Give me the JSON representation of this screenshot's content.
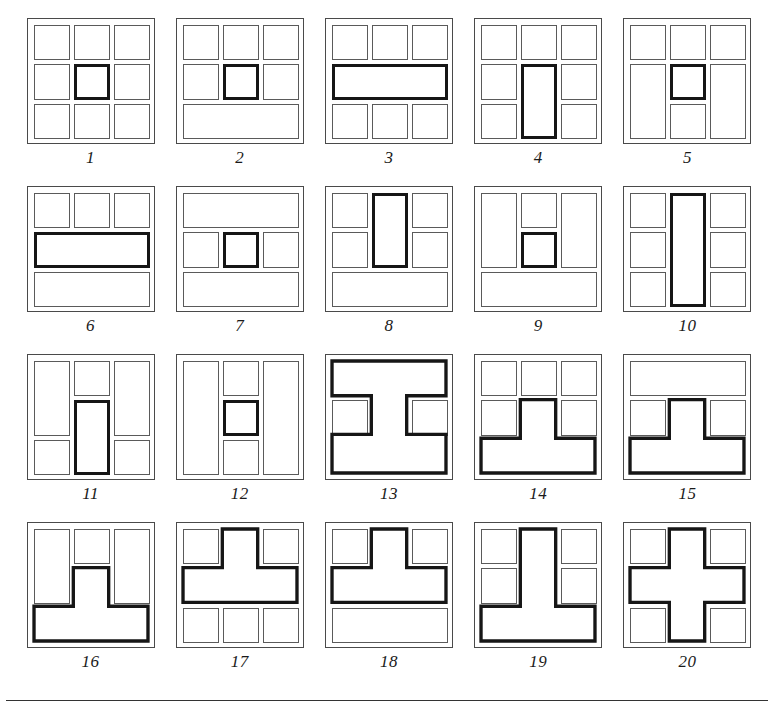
{
  "page": {
    "figure_count": 20,
    "bottom_rule": true,
    "colors": {
      "thin_stroke": "#5a5a5a",
      "bold_stroke": "#161616",
      "background": "#ffffff",
      "caption": "#1a1a1a"
    }
  },
  "figures": [
    {
      "number": "1",
      "caption": "1",
      "description": "3x3 grid of nine squares, center square bold",
      "parts": [
        {
          "kind": "thin",
          "x": 0,
          "y": 0,
          "w": 1,
          "h": 1
        },
        {
          "kind": "thin",
          "x": 1,
          "y": 0,
          "w": 1,
          "h": 1
        },
        {
          "kind": "thin",
          "x": 2,
          "y": 0,
          "w": 1,
          "h": 1
        },
        {
          "kind": "thin",
          "x": 0,
          "y": 1,
          "w": 1,
          "h": 1
        },
        {
          "kind": "bold",
          "x": 1,
          "y": 1,
          "w": 1,
          "h": 1
        },
        {
          "kind": "thin",
          "x": 2,
          "y": 1,
          "w": 1,
          "h": 1
        },
        {
          "kind": "thin",
          "x": 0,
          "y": 2,
          "w": 1,
          "h": 1
        },
        {
          "kind": "thin",
          "x": 1,
          "y": 2,
          "w": 1,
          "h": 1
        },
        {
          "kind": "thin",
          "x": 2,
          "y": 2,
          "w": 1,
          "h": 1
        }
      ]
    },
    {
      "number": "2",
      "caption": "2",
      "description": "two rows of three squares with bold center, wide bottom bar",
      "parts": [
        {
          "kind": "thin",
          "x": 0,
          "y": 0,
          "w": 1,
          "h": 1
        },
        {
          "kind": "thin",
          "x": 1,
          "y": 0,
          "w": 1,
          "h": 1
        },
        {
          "kind": "thin",
          "x": 2,
          "y": 0,
          "w": 1,
          "h": 1
        },
        {
          "kind": "thin",
          "x": 0,
          "y": 1,
          "w": 1,
          "h": 1
        },
        {
          "kind": "bold",
          "x": 1,
          "y": 1,
          "w": 1,
          "h": 1
        },
        {
          "kind": "thin",
          "x": 2,
          "y": 1,
          "w": 1,
          "h": 1
        },
        {
          "kind": "thin",
          "x": 0,
          "y": 2,
          "w": 3,
          "h": 1
        }
      ]
    },
    {
      "number": "3",
      "caption": "3",
      "description": "three squares, bold wide middle bar, three squares",
      "parts": [
        {
          "kind": "thin",
          "x": 0,
          "y": 0,
          "w": 1,
          "h": 1
        },
        {
          "kind": "thin",
          "x": 1,
          "y": 0,
          "w": 1,
          "h": 1
        },
        {
          "kind": "thin",
          "x": 2,
          "y": 0,
          "w": 1,
          "h": 1
        },
        {
          "kind": "bold",
          "x": 0,
          "y": 1,
          "w": 3,
          "h": 1
        },
        {
          "kind": "thin",
          "x": 0,
          "y": 2,
          "w": 1,
          "h": 1
        },
        {
          "kind": "thin",
          "x": 1,
          "y": 2,
          "w": 1,
          "h": 1
        },
        {
          "kind": "thin",
          "x": 2,
          "y": 2,
          "w": 1,
          "h": 1
        }
      ]
    },
    {
      "number": "4",
      "caption": "4",
      "description": "top row three squares, bold tall center rectangle over rows 2-3",
      "parts": [
        {
          "kind": "thin",
          "x": 0,
          "y": 0,
          "w": 1,
          "h": 1
        },
        {
          "kind": "thin",
          "x": 1,
          "y": 0,
          "w": 1,
          "h": 1
        },
        {
          "kind": "thin",
          "x": 2,
          "y": 0,
          "w": 1,
          "h": 1
        },
        {
          "kind": "thin",
          "x": 0,
          "y": 1,
          "w": 1,
          "h": 1
        },
        {
          "kind": "bold",
          "x": 1,
          "y": 1,
          "w": 1,
          "h": 2
        },
        {
          "kind": "thin",
          "x": 2,
          "y": 1,
          "w": 1,
          "h": 1
        },
        {
          "kind": "thin",
          "x": 0,
          "y": 2,
          "w": 1,
          "h": 1
        },
        {
          "kind": "thin",
          "x": 2,
          "y": 2,
          "w": 1,
          "h": 1
        }
      ]
    },
    {
      "number": "5",
      "caption": "5",
      "description": "top row three squares, tall side rectangles, bold center square",
      "parts": [
        {
          "kind": "thin",
          "x": 0,
          "y": 0,
          "w": 1,
          "h": 1
        },
        {
          "kind": "thin",
          "x": 1,
          "y": 0,
          "w": 1,
          "h": 1
        },
        {
          "kind": "thin",
          "x": 2,
          "y": 0,
          "w": 1,
          "h": 1
        },
        {
          "kind": "thin",
          "x": 0,
          "y": 1,
          "w": 1,
          "h": 2
        },
        {
          "kind": "bold",
          "x": 1,
          "y": 1,
          "w": 1,
          "h": 1
        },
        {
          "kind": "thin",
          "x": 2,
          "y": 1,
          "w": 1,
          "h": 2
        },
        {
          "kind": "thin",
          "x": 1,
          "y": 2,
          "w": 1,
          "h": 1
        }
      ]
    },
    {
      "number": "6",
      "caption": "6",
      "description": "three squares, bold wide bar, thin wide bar",
      "parts": [
        {
          "kind": "thin",
          "x": 0,
          "y": 0,
          "w": 1,
          "h": 1
        },
        {
          "kind": "thin",
          "x": 1,
          "y": 0,
          "w": 1,
          "h": 1
        },
        {
          "kind": "thin",
          "x": 2,
          "y": 0,
          "w": 1,
          "h": 1
        },
        {
          "kind": "bold",
          "x": 0,
          "y": 1,
          "w": 3,
          "h": 1
        },
        {
          "kind": "thin",
          "x": 0,
          "y": 2,
          "w": 3,
          "h": 1
        }
      ]
    },
    {
      "number": "7",
      "caption": "7",
      "description": "wide bar, three squares with bold center, wide bar",
      "parts": [
        {
          "kind": "thin",
          "x": 0,
          "y": 0,
          "w": 3,
          "h": 1
        },
        {
          "kind": "thin",
          "x": 0,
          "y": 1,
          "w": 1,
          "h": 1
        },
        {
          "kind": "bold",
          "x": 1,
          "y": 1,
          "w": 1,
          "h": 1
        },
        {
          "kind": "thin",
          "x": 2,
          "y": 1,
          "w": 1,
          "h": 1
        },
        {
          "kind": "thin",
          "x": 0,
          "y": 2,
          "w": 3,
          "h": 1
        }
      ]
    },
    {
      "number": "8",
      "caption": "8",
      "description": "bold tall center rectangle rows 1-2, side squares, wide bottom bar",
      "parts": [
        {
          "kind": "thin",
          "x": 0,
          "y": 0,
          "w": 1,
          "h": 1
        },
        {
          "kind": "bold",
          "x": 1,
          "y": 0,
          "w": 1,
          "h": 2
        },
        {
          "kind": "thin",
          "x": 2,
          "y": 0,
          "w": 1,
          "h": 1
        },
        {
          "kind": "thin",
          "x": 0,
          "y": 1,
          "w": 1,
          "h": 1
        },
        {
          "kind": "thin",
          "x": 2,
          "y": 1,
          "w": 1,
          "h": 1
        },
        {
          "kind": "thin",
          "x": 0,
          "y": 2,
          "w": 3,
          "h": 1
        }
      ]
    },
    {
      "number": "9",
      "caption": "9",
      "description": "tall side rectangles rows 1-2, center square then bold square, wide bottom bar",
      "parts": [
        {
          "kind": "thin",
          "x": 0,
          "y": 0,
          "w": 1,
          "h": 2
        },
        {
          "kind": "thin",
          "x": 1,
          "y": 0,
          "w": 1,
          "h": 1
        },
        {
          "kind": "thin",
          "x": 2,
          "y": 0,
          "w": 1,
          "h": 2
        },
        {
          "kind": "bold",
          "x": 1,
          "y": 1,
          "w": 1,
          "h": 1
        },
        {
          "kind": "thin",
          "x": 0,
          "y": 2,
          "w": 3,
          "h": 1
        }
      ]
    },
    {
      "number": "10",
      "caption": "10",
      "description": "bold full-height center column, three squares each side",
      "parts": [
        {
          "kind": "thin",
          "x": 0,
          "y": 0,
          "w": 1,
          "h": 1
        },
        {
          "kind": "bold",
          "x": 1,
          "y": 0,
          "w": 1,
          "h": 3
        },
        {
          "kind": "thin",
          "x": 2,
          "y": 0,
          "w": 1,
          "h": 1
        },
        {
          "kind": "thin",
          "x": 0,
          "y": 1,
          "w": 1,
          "h": 1
        },
        {
          "kind": "thin",
          "x": 2,
          "y": 1,
          "w": 1,
          "h": 1
        },
        {
          "kind": "thin",
          "x": 0,
          "y": 2,
          "w": 1,
          "h": 1
        },
        {
          "kind": "thin",
          "x": 2,
          "y": 2,
          "w": 1,
          "h": 1
        }
      ]
    },
    {
      "number": "11",
      "caption": "11",
      "description": "tall side rectangles rows 1-2, center square then bold tall rectangle rows 2-3",
      "parts": [
        {
          "kind": "thin",
          "x": 0,
          "y": 0,
          "w": 1,
          "h": 2
        },
        {
          "kind": "thin",
          "x": 1,
          "y": 0,
          "w": 1,
          "h": 1
        },
        {
          "kind": "thin",
          "x": 2,
          "y": 0,
          "w": 1,
          "h": 2
        },
        {
          "kind": "bold",
          "x": 1,
          "y": 1,
          "w": 1,
          "h": 2
        },
        {
          "kind": "thin",
          "x": 0,
          "y": 2,
          "w": 1,
          "h": 1
        },
        {
          "kind": "thin",
          "x": 2,
          "y": 2,
          "w": 1,
          "h": 1
        }
      ]
    },
    {
      "number": "12",
      "caption": "12",
      "description": "full-height side rectangles, three center squares with bold middle",
      "parts": [
        {
          "kind": "thin",
          "x": 0,
          "y": 0,
          "w": 1,
          "h": 3
        },
        {
          "kind": "thin",
          "x": 1,
          "y": 0,
          "w": 1,
          "h": 1
        },
        {
          "kind": "thin",
          "x": 2,
          "y": 0,
          "w": 1,
          "h": 3
        },
        {
          "kind": "bold",
          "x": 1,
          "y": 1,
          "w": 1,
          "h": 1
        },
        {
          "kind": "thin",
          "x": 1,
          "y": 2,
          "w": 1,
          "h": 1
        }
      ]
    },
    {
      "number": "13",
      "caption": "13",
      "description": "bold I-shape: full top bar, center column, full bottom bar, with side squares in middle row",
      "parts": [
        {
          "kind": "thin",
          "x": 0,
          "y": 1,
          "w": 1,
          "h": 1
        },
        {
          "kind": "thin",
          "x": 2,
          "y": 1,
          "w": 1,
          "h": 1
        },
        {
          "kind": "shape",
          "path": "I"
        }
      ]
    },
    {
      "number": "14",
      "caption": "14",
      "description": "three top squares, two side squares, bold inverted T using center of row 2 and full bottom row",
      "parts": [
        {
          "kind": "thin",
          "x": 0,
          "y": 0,
          "w": 1,
          "h": 1
        },
        {
          "kind": "thin",
          "x": 1,
          "y": 0,
          "w": 1,
          "h": 1
        },
        {
          "kind": "thin",
          "x": 2,
          "y": 0,
          "w": 1,
          "h": 1
        },
        {
          "kind": "thin",
          "x": 0,
          "y": 1,
          "w": 1,
          "h": 1
        },
        {
          "kind": "thin",
          "x": 2,
          "y": 1,
          "w": 1,
          "h": 1
        },
        {
          "kind": "shape",
          "path": "T_down"
        }
      ]
    },
    {
      "number": "15",
      "caption": "15",
      "description": "wide top bar, two side squares, bold inverted T using center of row 2 and full bottom row",
      "parts": [
        {
          "kind": "thin",
          "x": 0,
          "y": 0,
          "w": 3,
          "h": 1
        },
        {
          "kind": "thin",
          "x": 0,
          "y": 1,
          "w": 1,
          "h": 1
        },
        {
          "kind": "thin",
          "x": 2,
          "y": 1,
          "w": 1,
          "h": 1
        },
        {
          "kind": "shape",
          "path": "T_down"
        }
      ]
    },
    {
      "number": "16",
      "caption": "16",
      "description": "tall side rectangles rows 1-2, center top square, bold inverted T",
      "parts": [
        {
          "kind": "thin",
          "x": 0,
          "y": 0,
          "w": 1,
          "h": 2
        },
        {
          "kind": "thin",
          "x": 1,
          "y": 0,
          "w": 1,
          "h": 1
        },
        {
          "kind": "thin",
          "x": 2,
          "y": 0,
          "w": 1,
          "h": 2
        },
        {
          "kind": "shape",
          "path": "T_down"
        }
      ]
    },
    {
      "number": "17",
      "caption": "17",
      "description": "two top side squares, bold T using center of row 1 and full row 2, three bottom squares",
      "parts": [
        {
          "kind": "thin",
          "x": 0,
          "y": 0,
          "w": 1,
          "h": 1
        },
        {
          "kind": "thin",
          "x": 2,
          "y": 0,
          "w": 1,
          "h": 1
        },
        {
          "kind": "thin",
          "x": 0,
          "y": 2,
          "w": 1,
          "h": 1
        },
        {
          "kind": "thin",
          "x": 1,
          "y": 2,
          "w": 1,
          "h": 1
        },
        {
          "kind": "thin",
          "x": 2,
          "y": 2,
          "w": 1,
          "h": 1
        },
        {
          "kind": "shape",
          "path": "T_up"
        }
      ]
    },
    {
      "number": "18",
      "caption": "18",
      "description": "two top side squares, bold T using center of row 1 and full row 2, wide bottom bar",
      "parts": [
        {
          "kind": "thin",
          "x": 0,
          "y": 0,
          "w": 1,
          "h": 1
        },
        {
          "kind": "thin",
          "x": 2,
          "y": 0,
          "w": 1,
          "h": 1
        },
        {
          "kind": "thin",
          "x": 0,
          "y": 2,
          "w": 3,
          "h": 1
        },
        {
          "kind": "shape",
          "path": "T_up"
        }
      ]
    },
    {
      "number": "19",
      "caption": "19",
      "description": "four side squares rows 1-2, bold tall inverted T: center column rows 1-2 plus full bottom row",
      "parts": [
        {
          "kind": "thin",
          "x": 0,
          "y": 0,
          "w": 1,
          "h": 1
        },
        {
          "kind": "thin",
          "x": 2,
          "y": 0,
          "w": 1,
          "h": 1
        },
        {
          "kind": "thin",
          "x": 0,
          "y": 1,
          "w": 1,
          "h": 1
        },
        {
          "kind": "thin",
          "x": 2,
          "y": 1,
          "w": 1,
          "h": 1
        },
        {
          "kind": "shape",
          "path": "T_tall"
        }
      ]
    },
    {
      "number": "20",
      "caption": "20",
      "description": "bold plus/cross shape with four corner squares",
      "parts": [
        {
          "kind": "thin",
          "x": 0,
          "y": 0,
          "w": 1,
          "h": 1
        },
        {
          "kind": "thin",
          "x": 2,
          "y": 0,
          "w": 1,
          "h": 1
        },
        {
          "kind": "thin",
          "x": 0,
          "y": 2,
          "w": 1,
          "h": 1
        },
        {
          "kind": "thin",
          "x": 2,
          "y": 2,
          "w": 1,
          "h": 1
        },
        {
          "kind": "shape",
          "path": "plus"
        }
      ]
    }
  ]
}
